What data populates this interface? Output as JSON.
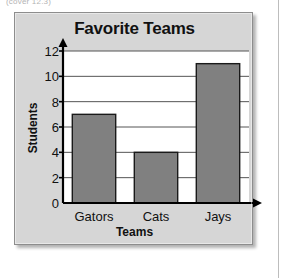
{
  "page": {
    "clipped_note": "(cover 12.3)",
    "background_color": "#ffffff"
  },
  "panel": {
    "background_color": "#d6d6d6",
    "border_color": "#8d8d8d"
  },
  "chart_data": {
    "type": "bar",
    "title": "Favorite Teams",
    "xlabel": "Teams",
    "ylabel": "Students",
    "categories": [
      "Gators",
      "Cats",
      "Jays"
    ],
    "values": [
      7,
      4,
      11
    ],
    "ylim": [
      0,
      12
    ],
    "ytick_step": 2,
    "yticks": [
      0,
      2,
      4,
      6,
      8,
      10,
      12
    ],
    "ytick_labels": [
      "0",
      "2",
      "4",
      "6",
      "8",
      "10",
      "12"
    ],
    "grid": "horizontal",
    "legend": null,
    "bar_color": "#808080",
    "bar_edge_color": "#1a1a1a",
    "plot_background": "#ffffff",
    "axis_color": "#000000",
    "gridline_color": "#555555",
    "axis_arrows": [
      "y-up",
      "x-right"
    ]
  }
}
